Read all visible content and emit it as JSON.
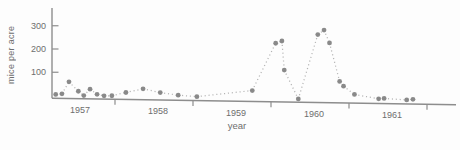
{
  "chart_data": {
    "type": "scatter",
    "title": "",
    "xlabel": "year",
    "ylabel": "mice per acre",
    "x_tick_labels": [
      "1957",
      "1958",
      "1959",
      "1960",
      "1961"
    ],
    "y_ticks": [
      100,
      200,
      300
    ],
    "y_tick_labels": [
      "100",
      "200",
      "300"
    ],
    "xlim": [
      1956.9,
      1962.4
    ],
    "ylim": [
      0,
      350
    ],
    "grid": "off",
    "legend": "none",
    "line_style": "dotted",
    "series": [
      {
        "name": "mice density",
        "points": [
          {
            "year": 1957.24,
            "value": 5
          },
          {
            "year": 1957.32,
            "value": 8
          },
          {
            "year": 1957.41,
            "value": 60
          },
          {
            "year": 1957.53,
            "value": 20
          },
          {
            "year": 1957.6,
            "value": 2
          },
          {
            "year": 1957.68,
            "value": 30
          },
          {
            "year": 1957.77,
            "value": 8
          },
          {
            "year": 1957.86,
            "value": 2
          },
          {
            "year": 1957.96,
            "value": 3
          },
          {
            "year": 1958.14,
            "value": 18
          },
          {
            "year": 1958.36,
            "value": 35
          },
          {
            "year": 1958.58,
            "value": 20
          },
          {
            "year": 1958.81,
            "value": 10
          },
          {
            "year": 1959.05,
            "value": 5
          },
          {
            "year": 1959.76,
            "value": 35
          },
          {
            "year": 1960.06,
            "value": 240
          },
          {
            "year": 1960.14,
            "value": 250
          },
          {
            "year": 1960.17,
            "value": 125
          },
          {
            "year": 1960.35,
            "value": 2
          },
          {
            "year": 1960.6,
            "value": 280
          },
          {
            "year": 1960.68,
            "value": 300
          },
          {
            "year": 1960.75,
            "value": 245
          },
          {
            "year": 1960.88,
            "value": 80
          },
          {
            "year": 1960.93,
            "value": 60
          },
          {
            "year": 1961.07,
            "value": 25
          },
          {
            "year": 1961.38,
            "value": 8
          },
          {
            "year": 1961.45,
            "value": 10
          },
          {
            "year": 1961.74,
            "value": 5
          },
          {
            "year": 1961.82,
            "value": 8
          }
        ]
      }
    ]
  },
  "style": {
    "dot_color": "#848484",
    "connector_color": "#b4b4b4",
    "axis_color": "#8d8d8d",
    "text_color": "#6e6e6e",
    "background": "#fdfdfd"
  }
}
